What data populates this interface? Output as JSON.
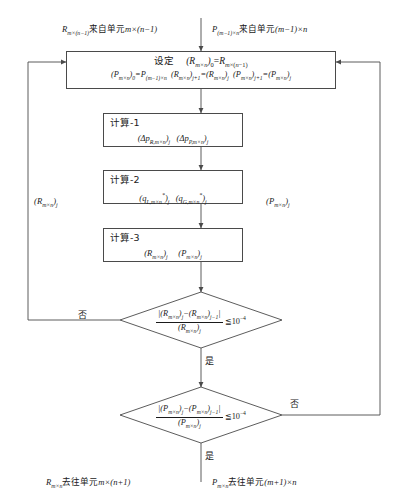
{
  "diagram": {
    "type": "flowchart",
    "language": "zh-CN",
    "colors": {
      "line": "#4a4a4a",
      "text": "#1a1a1a",
      "background": "#ffffff"
    },
    "inputs": {
      "left_label": "R_{m×(n-1)}来自单元m×(n-1)",
      "right_label": "P_{(m-1)×n}来自单元(m-1)×n"
    },
    "outputs": {
      "left_label": "R_{m×n}去往单元m×(n+1)",
      "right_label": "P_{m×n}去往单元(m+1)×n"
    },
    "setup_box": {
      "name": "设定",
      "line1": "设定    (R_{m×n})₀=R_{m×(n-1)}",
      "line2": "(P_{m×n})₀=P_{(m-1)×n} (R_{m×n})_{j+1}=(R_{m×n})_j (P_{m×n})_{j+1}=(P_{m×n})_j"
    },
    "process_boxes": [
      {
        "title": "计算-1",
        "body": "(Δp_{R,m×n})_j   (Δp_{P,m×n})_j"
      },
      {
        "title": "计算-2",
        "body": "(q_{L,m×n}*)_j   (q_{G,m×n}*)_j"
      },
      {
        "title": "计算-3",
        "body": "(R_{m×n})_j      (P_{m×n})_j"
      }
    ],
    "decisions": [
      {
        "id": "decision-r",
        "numerator": "|(R_{m×n})_j−(R_{m×n})_{j−1}|",
        "denominator": "(R_{m×n})_j",
        "comparator": "≤",
        "threshold": "10⁻⁴",
        "no_label": "否",
        "yes_label": "是"
      },
      {
        "id": "decision-p",
        "numerator": "|(P_{m×n})_j−(P_{m×n})_{j−1}|",
        "denominator": "(P_{m×n})_j",
        "comparator": "≤",
        "threshold": "10⁻⁴",
        "no_label": "否",
        "yes_label": "是"
      }
    ],
    "feedback_labels": {
      "left": "(R_{m×n})_j",
      "right": "(P_{m×n})_j"
    }
  }
}
